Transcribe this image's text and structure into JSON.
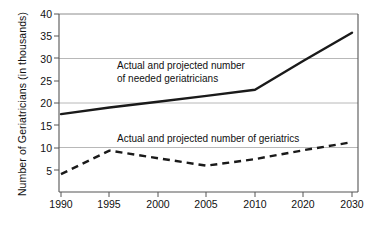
{
  "chart_data": {
    "type": "line",
    "title": "",
    "xlabel": "",
    "ylabel": "Number of Geriatricians (in thousands)",
    "x_tick_labels": [
      "1990",
      "1995",
      "2000",
      "2005",
      "2010",
      "2020",
      "2030"
    ],
    "y_tick_labels": [
      "5",
      "10",
      "15",
      "20",
      "25",
      "30",
      "35",
      "40"
    ],
    "y_tick_values": [
      5,
      10,
      15,
      20,
      25,
      30,
      35,
      40
    ],
    "ylim": [
      0,
      40
    ],
    "gridlines": {
      "horizontal_at": [
        10,
        20,
        30,
        40
      ],
      "vertical": false
    },
    "legend": {
      "visible": false,
      "position": "none"
    },
    "annotations": [
      {
        "name": "needed-geriatricians-label",
        "line1": "Actual and projected number",
        "line2": "of needed geriatricians"
      },
      {
        "name": "geriatrics-label",
        "line1": "Actual and projected number of geriatrics"
      }
    ],
    "series": [
      {
        "name": "Actual and projected number of needed geriatricians",
        "style": "solid",
        "color": "#1a1a1a",
        "x": [
          "1990",
          "1995",
          "2000",
          "2005",
          "2010",
          "2020",
          "2030"
        ],
        "values": [
          17.5,
          19.0,
          20.3,
          21.6,
          23.0,
          29.5,
          35.8
        ]
      },
      {
        "name": "Actual and projected number of geriatrics",
        "style": "dashed",
        "color": "#1a1a1a",
        "x": [
          "1990",
          "1995",
          "2000",
          "2005",
          "2010",
          "2020",
          "2030"
        ],
        "values": [
          4.0,
          9.3,
          7.6,
          5.9,
          7.4,
          9.4,
          11.2
        ]
      }
    ]
  },
  "axis_title": {
    "y": "Number of Geriatricians (in thousands)"
  },
  "colors": {
    "series_line": "#1a1a1a",
    "axis": "#555555",
    "grid": "#b8b8b8",
    "background": "#ffffff",
    "text": "#111111"
  }
}
